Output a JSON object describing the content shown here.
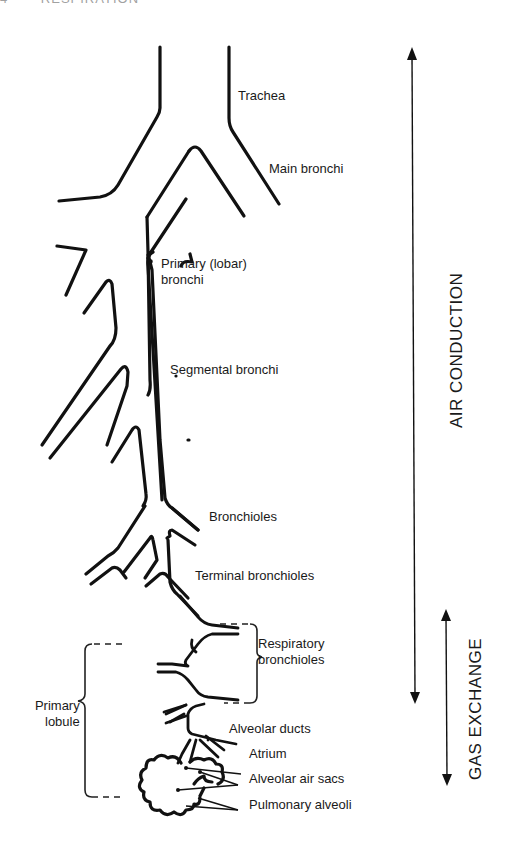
{
  "page": {
    "header_number": "4",
    "header_title": "RESPIRATION"
  },
  "diagram": {
    "structures": [
      {
        "id": "trachea",
        "label": "Trachea"
      },
      {
        "id": "main_bronchi",
        "label": "Main bronchi"
      },
      {
        "id": "primary_bronchi",
        "label": "Primary (lobar)",
        "label_line2": "bronchi"
      },
      {
        "id": "segmental_bronchi",
        "label": "Segmental bronchi"
      },
      {
        "id": "bronchioles",
        "label": "Bronchioles"
      },
      {
        "id": "terminal_bronchioles",
        "label": "Terminal bronchioles"
      },
      {
        "id": "respiratory_bronchioles",
        "label": "Respiratory",
        "label_line2": "bronchioles"
      },
      {
        "id": "alveolar_ducts",
        "label": "Alveolar ducts"
      },
      {
        "id": "atrium",
        "label": "Atrium"
      },
      {
        "id": "alveolar_air_sacs",
        "label": "Alveolar air sacs"
      },
      {
        "id": "pulmonary_alveoli",
        "label": "Pulmonary alveoli"
      }
    ],
    "groupings": {
      "primary_lobule": {
        "label": "Primary",
        "label_line2": "lobule"
      }
    },
    "zones": {
      "air_conduction": "AIR CONDUCTION",
      "gas_exchange": "GAS EXCHANGE"
    },
    "colors": {
      "line": "#111111",
      "background": "#ffffff"
    }
  }
}
